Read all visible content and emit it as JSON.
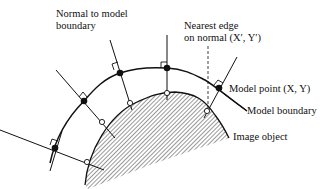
{
  "labels": {
    "normal": [
      "Normal to model",
      "boundary"
    ],
    "nearest": [
      "Nearest edge",
      "on normal (X′, Y′)"
    ],
    "model_point": "Model point (X, Y)",
    "model_boundary": "Model boundary",
    "image_object": "Image object"
  },
  "colors": {
    "ink": "#111111",
    "background": "#ffffff"
  }
}
